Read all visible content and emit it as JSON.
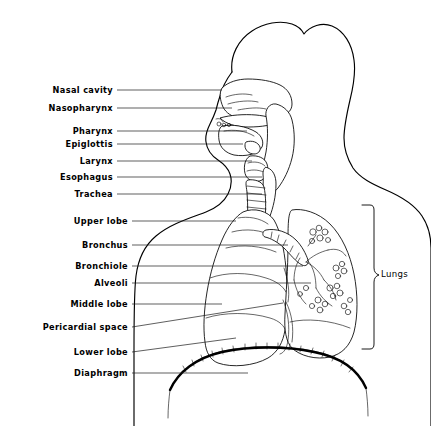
{
  "figure": {
    "background_color": "#ffffff",
    "ink_color": "#000000",
    "width": 431,
    "height": 426
  },
  "labels_left": [
    {
      "id": "nasal-cavity",
      "text": "Nasal cavity",
      "text_x": 113,
      "text_y": 93,
      "leader": "M 117 90 L 222 90"
    },
    {
      "id": "nasopharynx",
      "text": "Nasopharynx",
      "text_x": 113,
      "text_y": 111,
      "leader": "M 117 108 L 232 108"
    },
    {
      "id": "pharynx",
      "text": "Pharynx",
      "text_x": 113,
      "text_y": 134,
      "leader": "M 117 131 L 247 131"
    },
    {
      "id": "epiglottis",
      "text": "Epiglottis",
      "text_x": 113,
      "text_y": 147,
      "leader": "M 117 144 L 243 144"
    },
    {
      "id": "larynx",
      "text": "Larynx",
      "text_x": 113,
      "text_y": 164,
      "leader": "M 117 161 L 252 161"
    },
    {
      "id": "esophagus",
      "text": "Esophagus",
      "text_x": 113,
      "text_y": 180,
      "leader": "M 117 177 L 262 177"
    },
    {
      "id": "trachea",
      "text": "Trachea",
      "text_x": 113,
      "text_y": 197,
      "leader": "M 117 194 L 262 194"
    },
    {
      "id": "upper-lobe",
      "text": "Upper lobe",
      "text_x": 128,
      "text_y": 224,
      "leader": "M 132 221 L 236 221"
    },
    {
      "id": "bronchus",
      "text": "Bronchus",
      "text_x": 128,
      "text_y": 248,
      "leader": "M 132 245 L 288 245"
    },
    {
      "id": "bronchiole",
      "text": "Bronchiole",
      "text_x": 128,
      "text_y": 269,
      "leader": "M 132 266 L 303 266"
    },
    {
      "id": "alveoli",
      "text": "Alveoli",
      "text_x": 128,
      "text_y": 286,
      "leader": "M 132 283 L 311 283"
    },
    {
      "id": "middle-lobe",
      "text": "Middle lobe",
      "text_x": 128,
      "text_y": 307,
      "leader": "M 132 304 L 222 304"
    },
    {
      "id": "pericardial-space",
      "text": "Pericardial space",
      "text_x": 128,
      "text_y": 330,
      "leader": "M 132 327 L 283 303"
    },
    {
      "id": "lower-lobe",
      "text": "Lower lobe",
      "text_x": 128,
      "text_y": 355,
      "leader": "M 132 352 L 236 338"
    },
    {
      "id": "diaphragm",
      "text": "Diaphragm",
      "text_x": 128,
      "text_y": 376,
      "leader": "M 132 373 L 248 373"
    }
  ],
  "labels_right": [
    {
      "id": "lungs",
      "text": "Lungs",
      "text_x": 381,
      "text_y": 277
    }
  ],
  "annotations": {
    "brace_description": "curly brace spanning lung field height at right",
    "figure_orientation": "head and neck in left lateral profile, thorax in frontal view"
  }
}
